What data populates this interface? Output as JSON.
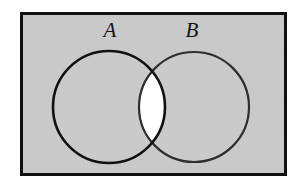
{
  "figure": {
    "type": "venn-diagram",
    "canvas": {
      "width": 304,
      "height": 188,
      "background": "#ffffff"
    },
    "frame": {
      "name": "universal-set-rectangle",
      "x": 20,
      "y": 12,
      "width": 267,
      "height": 164,
      "border_color": "#111111",
      "border_width": 3,
      "fill": "#cacaca"
    },
    "sets": [
      {
        "label": "A",
        "name": "set-a",
        "cx": 109,
        "cy": 107,
        "r": 56,
        "stroke": "#111111",
        "stroke_width": 2.6,
        "fill": "#cacaca",
        "label_x": 110,
        "label_y": 37
      },
      {
        "label": "B",
        "name": "set-b",
        "cx": 194,
        "cy": 107,
        "r": 55,
        "stroke": "#2e2e2e",
        "stroke_width": 2.2,
        "fill": "#cacaca",
        "label_x": 192,
        "label_y": 37
      }
    ],
    "intersection": {
      "name": "intersection-region",
      "fill": "#ffffff",
      "top_crossing": {
        "x": 152,
        "y": 63
      },
      "bottom_crossing": {
        "x": 152,
        "y": 151
      }
    },
    "labels": {
      "set_a": "A",
      "set_b": "B"
    }
  }
}
